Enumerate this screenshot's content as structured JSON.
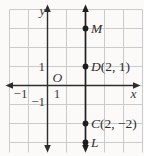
{
  "figure": {
    "axis_label_x": "x",
    "axis_label_y": "y",
    "origin_label": "O",
    "tick_y_pos": "1",
    "tick_y_neg": "−1",
    "tick_x_pos": "1",
    "tick_x_neg": "−1",
    "colors": {
      "background": "#fbfaf8",
      "grid": "#c8ccce",
      "axis": "#2d2d2d",
      "plot_line": "#1e1e1e",
      "point": "#1e1e1e",
      "text": "#3b3b3b"
    }
  },
  "chart_data": {
    "type": "scatter",
    "line": {
      "type": "vertical",
      "x": 2
    },
    "points": [
      {
        "name": "M",
        "label": "M",
        "x": 2,
        "y": 3
      },
      {
        "name": "D",
        "label": "D(2, 1)",
        "x": 2,
        "y": 1
      },
      {
        "name": "C",
        "label": "C(2, −2)",
        "x": 2,
        "y": -2
      },
      {
        "name": "L",
        "label": "L",
        "x": 2,
        "y": -3
      }
    ],
    "xlabel": "x",
    "ylabel": "y",
    "origin_label": "O",
    "x_tick_labels": [
      "−1",
      "1"
    ],
    "y_tick_labels": [
      "−1",
      "1"
    ],
    "xlim": [
      -2,
      5
    ],
    "ylim": [
      -3.5,
      4
    ],
    "grid": true,
    "grid_unit_px": 19,
    "legend": false
  }
}
